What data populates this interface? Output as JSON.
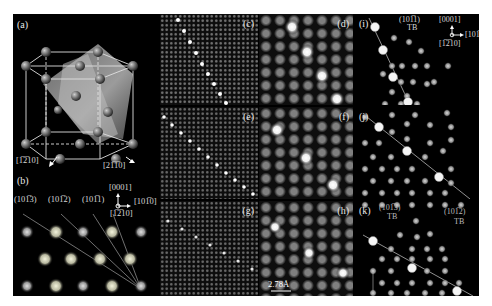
{
  "figure": {
    "panels": {
      "a": {
        "label": "(a)",
        "dir1": "[1̅2̅10]",
        "dir2": "[21̅1̅0]",
        "dir1_text": "[1210]",
        "dir2_text": "[2110]"
      },
      "b": {
        "label": "(b)",
        "planes": [
          "(101̅3)",
          "(101̅2)",
          "(101̅1)"
        ],
        "axis_up": "[0001]",
        "axis_right": "[101̅0]",
        "axis_out": "[1̅2̅10]"
      },
      "c": {
        "label": "(c)"
      },
      "d": {
        "label": "(d)"
      },
      "e": {
        "label": "(e)"
      },
      "f": {
        "label": "(f)"
      },
      "g": {
        "label": "(g)"
      },
      "h": {
        "label": "(h)",
        "scale_bar": "2.78Å"
      },
      "i": {
        "label": "(i)",
        "plane": "(101̅1)",
        "tb": "TB",
        "axis_up": "[0001]",
        "axis_right": "[101̅0]",
        "axis_out": "[1̅2̅10]",
        "marker": "Gd"
      },
      "j": {
        "label": "(j)",
        "marker": "Gd"
      },
      "k": {
        "label": "(k)",
        "plane1": "(101̅3)",
        "tb1": "TB",
        "plane2": "(101̅2)",
        "tb2": "TB",
        "marker": "Gd"
      }
    }
  }
}
